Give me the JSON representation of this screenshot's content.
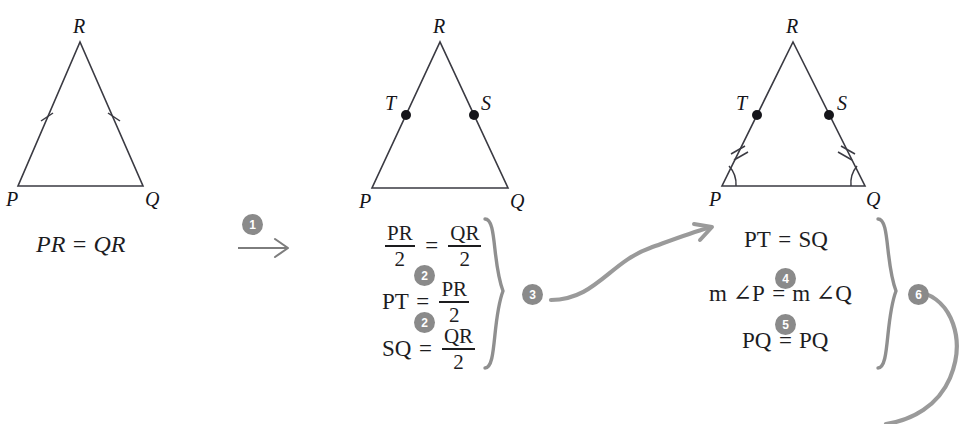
{
  "figure": {
    "background_color": "#ffffff",
    "ink_color": "#1d1d1f",
    "accent_gray": "#8a8a8a"
  },
  "steps": [
    {
      "id": "1",
      "label": "1"
    },
    {
      "id": "2a",
      "label": "2"
    },
    {
      "id": "2b",
      "label": "2"
    },
    {
      "id": "3",
      "label": "3"
    },
    {
      "id": "4",
      "label": "4"
    },
    {
      "id": "5",
      "label": "5"
    },
    {
      "id": "6",
      "label": "6"
    }
  ],
  "triangles": [
    {
      "name": "triangle-1",
      "vertices": {
        "apex": "R",
        "left": "P",
        "right": "Q"
      },
      "tick_marks": "single",
      "angle_arcs": false,
      "midpoints": [],
      "caption": "PR = QR"
    },
    {
      "name": "triangle-2",
      "vertices": {
        "apex": "R",
        "left": "P",
        "right": "Q"
      },
      "tick_marks": "none",
      "angle_arcs": false,
      "midpoints": [
        {
          "label": "T",
          "side": "left"
        },
        {
          "label": "S",
          "side": "right"
        }
      ],
      "caption": ""
    },
    {
      "name": "triangle-3",
      "vertices": {
        "apex": "R",
        "left": "P",
        "right": "Q"
      },
      "tick_marks": "double",
      "angle_arcs": true,
      "midpoints": [
        {
          "label": "T",
          "side": "left"
        },
        {
          "label": "S",
          "side": "right"
        }
      ],
      "caption": ""
    }
  ],
  "equation_groups": [
    {
      "name": "group-2",
      "brace_badge": "3",
      "lines": [
        {
          "id": "line-2-1",
          "badge": "",
          "left": {
            "type": "fraction",
            "num": "PR",
            "den": "2"
          },
          "op": "=",
          "right": {
            "type": "fraction",
            "num": "QR",
            "den": "2"
          },
          "plain": "PR/2 = QR/2"
        },
        {
          "id": "line-2-2",
          "badge": "2",
          "left": {
            "type": "text",
            "value": "PT"
          },
          "op": "=",
          "right": {
            "type": "fraction",
            "num": "PR",
            "den": "2"
          },
          "plain": "PT = PR/2"
        },
        {
          "id": "line-2-3",
          "badge": "2",
          "left": {
            "type": "text",
            "value": "SQ"
          },
          "op": "=",
          "right": {
            "type": "fraction",
            "num": "QR",
            "den": "2"
          },
          "plain": "SQ = QR/2"
        }
      ]
    },
    {
      "name": "group-3",
      "brace_badge": "6",
      "lines": [
        {
          "id": "line-3-1",
          "badge": "",
          "left": {
            "type": "text",
            "value": "PT"
          },
          "op": "=",
          "right": {
            "type": "text",
            "value": "SQ"
          },
          "plain": "PT = SQ"
        },
        {
          "id": "line-3-2",
          "badge": "4",
          "left": {
            "type": "text",
            "value": "m ∠P"
          },
          "op": "=",
          "right": {
            "type": "text",
            "value": "m ∠Q"
          },
          "plain": "m ∠P = m ∠Q"
        },
        {
          "id": "line-3-3",
          "badge": "5",
          "left": {
            "type": "text",
            "value": "PQ"
          },
          "op": "=",
          "right": {
            "type": "text",
            "value": "PQ"
          },
          "plain": "PQ = PQ"
        }
      ]
    }
  ],
  "connectors": [
    {
      "name": "arrow-straight-1",
      "kind": "straight-arrow",
      "badge": "1"
    },
    {
      "name": "arrow-curved-2",
      "kind": "curved-arrow",
      "badge": ""
    },
    {
      "name": "arrow-curved-3",
      "kind": "curved-tail",
      "badge": ""
    }
  ],
  "labels": {
    "R": "R",
    "P": "P",
    "Q": "Q",
    "T": "T",
    "S": "S"
  }
}
